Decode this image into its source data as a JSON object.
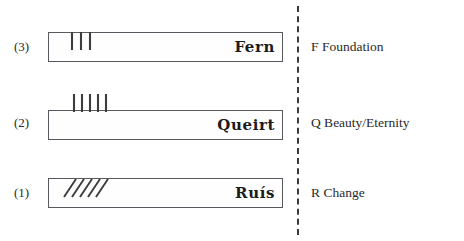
{
  "diagram": {
    "divider": "dashed-vertical-line",
    "rows": [
      {
        "index_label": "(3)",
        "letter_name": "Fern",
        "meaning": "F Foundation",
        "stroke_count": 3,
        "stroke_style": "vertical-above-stemline",
        "stroke_color": "#3d3d3d"
      },
      {
        "index_label": "(2)",
        "letter_name": "Queirt",
        "meaning": "Q Beauty/Eternity",
        "stroke_count": 5,
        "stroke_style": "vertical-above-stemline",
        "stroke_color": "#3d3d3d"
      },
      {
        "index_label": "(1)",
        "letter_name": "Ruís",
        "meaning": "R Change",
        "stroke_count": 5,
        "stroke_style": "diagonal-across-stemline",
        "stroke_color": "#3d3d3d"
      }
    ]
  },
  "colors": {
    "ink": "#231f20",
    "box_border": "#55585c",
    "divider": "#3a3a3a",
    "background": "#ffffff"
  }
}
